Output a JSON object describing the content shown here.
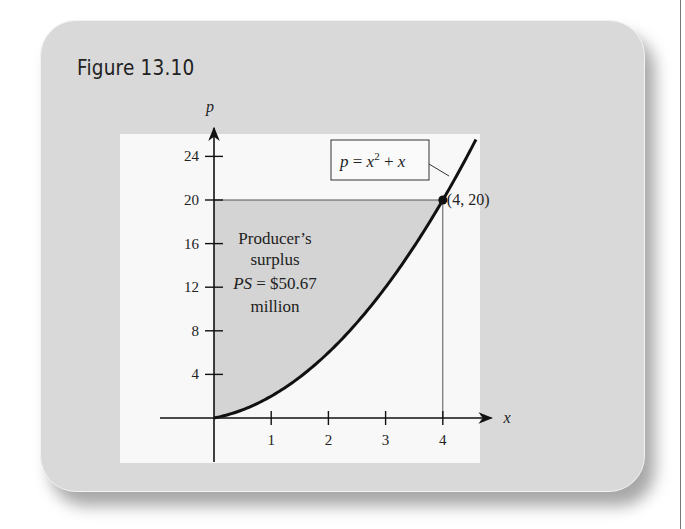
{
  "figure": {
    "title": "Figure 13.10"
  },
  "colors": {
    "card_bg": "#d9d9d9",
    "panel_bg": "#f8f8f8",
    "shaded_region": "#d4d4d4",
    "curve": "#111111"
  },
  "chart_data": {
    "type": "area",
    "title": "Figure 13.10",
    "xlabel": "x",
    "ylabel": "p",
    "xlim": [
      0,
      4.5
    ],
    "ylim": [
      0,
      25
    ],
    "x_ticks": [
      1,
      2,
      3,
      4
    ],
    "x_tick_labels": [
      "1",
      "2",
      "3",
      "4"
    ],
    "y_ticks": [
      4,
      8,
      12,
      16,
      20,
      24
    ],
    "y_tick_labels": [
      "4",
      "8",
      "12",
      "16",
      "20",
      "24"
    ],
    "grid": false,
    "series": [
      {
        "name": "p = x^2 + x",
        "x": [
          0,
          0.5,
          1,
          1.5,
          2,
          2.5,
          3,
          3.5,
          4,
          4.5
        ],
        "values": [
          0,
          0.75,
          2,
          3.75,
          6,
          8.75,
          12,
          15.75,
          20,
          24.75
        ]
      }
    ],
    "shaded_region": {
      "label": "Producer's surplus",
      "between": [
        "p = 20",
        "p = x^2 + x"
      ],
      "x_range": [
        0,
        4
      ]
    },
    "point": {
      "x": 4,
      "y": 20,
      "label": "(4, 20)"
    },
    "annotations": [
      "Producer’s",
      "surplus",
      "PS = $50.67",
      "million"
    ],
    "equation_label": {
      "p": "p",
      "eq": " = x",
      "exp": "2",
      "rest": " + x"
    }
  }
}
